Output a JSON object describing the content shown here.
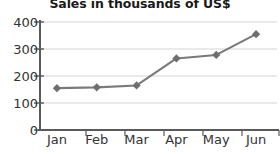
{
  "chart_data": {
    "type": "line",
    "title": "Sales in thousands of US$",
    "xlabel": "",
    "ylabel": "",
    "categories": [
      "Jan",
      "Feb",
      "Mar",
      "Apr",
      "May",
      "Jun"
    ],
    "values": [
      155,
      158,
      165,
      265,
      278,
      355
    ],
    "series": [
      {
        "name": "Sales",
        "values": [
          155,
          158,
          165,
          265,
          278,
          355
        ]
      }
    ],
    "ylim": [
      0,
      400
    ],
    "yticks": [
      0,
      100,
      200,
      300,
      400
    ],
    "ytick_labels": [
      "0",
      "100",
      "200",
      "300",
      "400"
    ],
    "grid": true,
    "grid_axis": "y",
    "legend": false,
    "legend_position": "none",
    "marker": "diamond",
    "colors": {
      "line": "#7a7a7a",
      "marker": "#6e6e6e",
      "grid": "#e3e3e3",
      "axis": "#5a5a5a",
      "title": "#1a1a1a",
      "tick_label": "#333333",
      "background": "#ffffff"
    }
  }
}
